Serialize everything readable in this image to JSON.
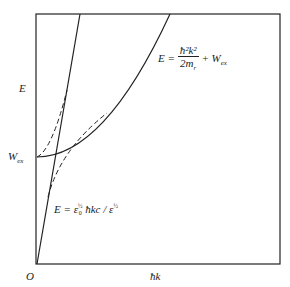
{
  "diagram": {
    "axes": {
      "y_label": "E",
      "x_label": "ħk",
      "origin_label": "O",
      "w_level_label": "W",
      "w_level_sub": "ex"
    },
    "curves": {
      "parabola": {
        "lhs": "E =",
        "numerator": "ħ²k²",
        "denominator": "2m",
        "denominator_sub": "r",
        "plus": "+ W",
        "plus_sub": "ex"
      },
      "line": {
        "lhs": "E = ε",
        "eps0_sup": "½",
        "eps0_sub": "0",
        "middle": "ħkc / ε",
        "eps_sup": "½"
      }
    },
    "line_styles": {
      "stroke": "#222222"
    }
  }
}
